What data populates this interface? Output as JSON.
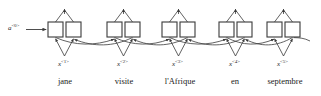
{
  "figure": {
    "type": "bidirectional-rnn-diagram",
    "initial_activation": {
      "base": "a",
      "superscript": "<0>"
    },
    "colors": {
      "stroke": "#3a3a3a",
      "text": "#222222",
      "background": "#ffffff",
      "box_fill": "#ffffff"
    },
    "timesteps": [
      {
        "index": 1,
        "input_label_base": "x",
        "input_label_superscript": "<1>",
        "word": "jane",
        "forward_box": "a-forward-1",
        "backward_box": "a-backward-1"
      },
      {
        "index": 2,
        "input_label_base": "x",
        "input_label_superscript": "<2>",
        "word": "visite",
        "forward_box": "a-forward-2",
        "backward_box": "a-backward-2"
      },
      {
        "index": 3,
        "input_label_base": "x",
        "input_label_superscript": "<3>",
        "word": "l'Afrique",
        "forward_box": "a-forward-3",
        "backward_box": "a-backward-3"
      },
      {
        "index": 4,
        "input_label_base": "x",
        "input_label_superscript": "<4>",
        "word": "en",
        "forward_box": "a-forward-4",
        "backward_box": "a-backward-4"
      },
      {
        "index": 5,
        "input_label_base": "x",
        "input_label_superscript": "<5>",
        "word": "septembre",
        "forward_box": "a-forward-5",
        "backward_box": "a-backward-5"
      }
    ]
  }
}
